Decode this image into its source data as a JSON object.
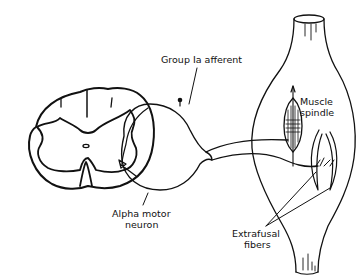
{
  "diagram": {
    "labels": {
      "group_ia_afferent": "Group Ia afferent",
      "muscle_spindle_line1": "Muscle",
      "muscle_spindle_line2": "spindle",
      "alpha_motor_neuron_line1": "Alpha motor",
      "alpha_motor_neuron_line2": "neuron",
      "extrafusal_fibers_line1": "Extrafusal",
      "extrafusal_fibers_line2": "fibers"
    },
    "colors": {
      "stroke": "#111111",
      "background": "#ffffff"
    }
  }
}
